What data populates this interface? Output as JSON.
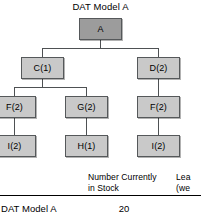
{
  "diagram": {
    "title": "DAT Model A",
    "nodes": [
      {
        "id": "a",
        "label": "A",
        "level": 0
      },
      {
        "id": "c1",
        "label": "C(1)",
        "level": 1
      },
      {
        "id": "d2",
        "label": "D(2)",
        "level": 1
      },
      {
        "id": "f2l",
        "label": "F(2)",
        "level": 2
      },
      {
        "id": "g2",
        "label": "G(2)",
        "level": 2
      },
      {
        "id": "f2r",
        "label": "F(2)",
        "level": 2
      },
      {
        "id": "i2l",
        "label": "I(2)",
        "level": 3
      },
      {
        "id": "h1",
        "label": "H(1)",
        "level": 3
      },
      {
        "id": "i2r",
        "label": "I(2)",
        "level": 3
      }
    ],
    "edges": [
      {
        "from": "a",
        "to": "c1"
      },
      {
        "from": "a",
        "to": "d2"
      },
      {
        "from": "c1",
        "to": "f2l"
      },
      {
        "from": "c1",
        "to": "g2"
      },
      {
        "from": "d2",
        "to": "f2r"
      },
      {
        "from": "f2l",
        "to": "i2l"
      },
      {
        "from": "g2",
        "to": "h1"
      },
      {
        "from": "f2r",
        "to": "i2r"
      }
    ],
    "colors": {
      "root_fill": "#9c9c9c",
      "node_fill": "#c9c9c9",
      "node_border": "#55585a",
      "wire": "#4e5153"
    }
  },
  "table": {
    "columns": [
      {
        "line1": "Number Currently",
        "line2": "in Stock"
      },
      {
        "line1": "Lea",
        "line2": "(we"
      }
    ],
    "rows": [
      {
        "label": "DAT Model A",
        "stock": "20"
      }
    ]
  }
}
